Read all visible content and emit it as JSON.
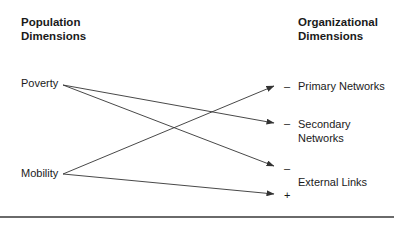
{
  "diagram": {
    "left_header": [
      "Population",
      "Dimensions"
    ],
    "right_header": [
      "Organizational",
      "Dimensions"
    ],
    "left_nodes": [
      {
        "id": "poverty",
        "label": "Poverty"
      },
      {
        "id": "mobility",
        "label": "Mobility"
      }
    ],
    "right_nodes": [
      {
        "id": "primary",
        "label": "Primary Networks"
      },
      {
        "id": "secondary",
        "label_lines": [
          "Secondary",
          "Networks"
        ]
      },
      {
        "id": "external",
        "label": "External Links"
      }
    ],
    "edges": [
      {
        "from": "Poverty",
        "to": "Secondary Networks",
        "sign": "–"
      },
      {
        "from": "Poverty",
        "to": "External Links",
        "sign": "–"
      },
      {
        "from": "Mobility",
        "to": "Primary Networks",
        "sign": "–"
      },
      {
        "from": "Mobility",
        "to": "External Links",
        "sign": "+"
      }
    ],
    "signs": {
      "primary": "–",
      "secondary": "–",
      "external_poverty": "–",
      "external_mobility": "+"
    },
    "colors": {
      "line": "#333333",
      "text": "#1a1a1a",
      "rule": "#6a6a6a"
    }
  }
}
